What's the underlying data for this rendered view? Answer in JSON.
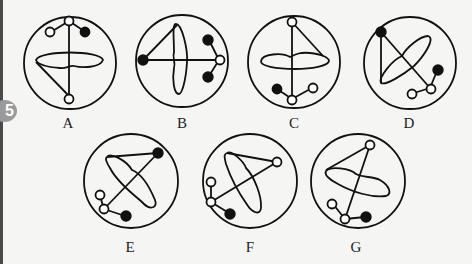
{
  "question_number": "5",
  "options": [
    {
      "label": "A"
    },
    {
      "label": "B"
    },
    {
      "label": "C"
    },
    {
      "label": "D"
    },
    {
      "label": "E"
    },
    {
      "label": "F"
    },
    {
      "label": "G"
    }
  ],
  "colors": {
    "stroke": "#111111",
    "fill_dark": "#111111",
    "fill_light": "#ffffff",
    "badge": "#9a9a9a"
  }
}
